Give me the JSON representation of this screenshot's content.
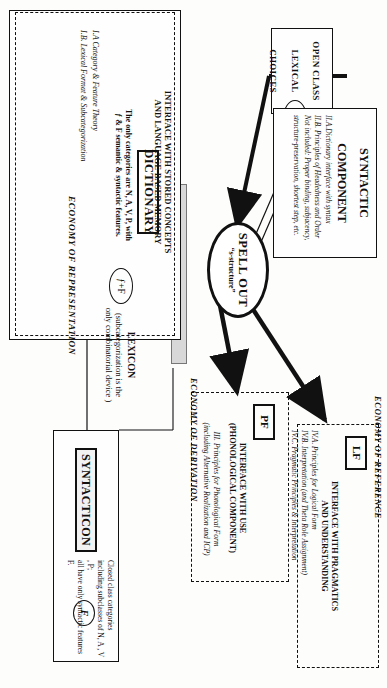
{
  "diagram": {
    "orientation_note": "rotated-90-clockwise"
  },
  "open_class": {
    "line1": "OPEN CLASS",
    "line2": "LEXICAL",
    "line3": "CHOICES"
  },
  "markers": {
    "f_plus_F_open": "ƒ+F",
    "f_plus_F_dictionary": "ƒ+F",
    "F_syntacticon": "F"
  },
  "syntactic_component": {
    "title_line1": "SYNTACTIC",
    "title_line2": "COMPONENT",
    "items": [
      "II.A.Dictionary interface with syntax",
      "II.B. Principles of Headedness and Order",
      "Not included: Proper binding, subjacency,",
      "structure-preservation, shortest step, etc."
    ]
  },
  "spell_out": {
    "title": "SPELL OUT",
    "subtitle": "“s-structure”"
  },
  "dictionary": {
    "interface_heading_line1": "INTERFACE WITH STORED CONCEPTS",
    "interface_heading_line2": "AND LANGUAGE-BASED MEMORY",
    "box_label": "DICTIONARY",
    "note_line1": "The only categories are N, A, V, P, with",
    "note_line2": "ƒ & F semantic & syntactic features.",
    "items": [
      "I.A Category & Feature Theory",
      "I.B. Lexical Format & Subcategorization"
    ]
  },
  "lexicon": {
    "title": "LEXICON",
    "note_line1": "(subcategorization is the",
    "note_line2": "only combinatorial device )"
  },
  "syntacticon": {
    "box_label": "SYNTACTICON",
    "note_line1": "Closed class categories",
    "note_line2": "including subclasses of N, A , V , P;",
    "note_line3": "all have only syntactic features F."
  },
  "pf": {
    "box_label": "PF",
    "heading_line1": "INTERFACE WITH USE",
    "heading_line2": "(PHONOLOGICAL COMPONENT)",
    "items": [
      "III. Principles for Phonological Form",
      "(including Alternative Realization and ICP)"
    ]
  },
  "lf": {
    "box_label": "LF",
    "heading_line1": "INTERFACE WITH PRAGMATICS",
    "heading_line2": "AND UNDERSTANDING",
    "items": [
      "IV.A. Principles for Logical Form",
      "IV.B. Interpretation (and Theta Role Assignment)",
      "IV.C. Pragmatic Principles & Interpretation"
    ]
  },
  "economy_labels": {
    "representation": "ECONOMY OF REPRESENTATION",
    "derivation": "ECONOMY OF DERIVATION",
    "reference": "ECONOMY OF REFERENCE"
  },
  "colors": {
    "ink": "#111111",
    "paper": "#fdfdfc",
    "shade": "#d8d8d8"
  }
}
